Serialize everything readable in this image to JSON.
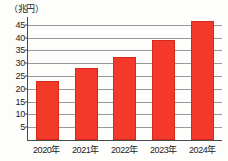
{
  "chart_data": {
    "type": "bar",
    "title": "",
    "subtitle": "",
    "unit_label": "（兆円）",
    "xlabel": "",
    "ylabel": "",
    "categories": [
      "2020年",
      "2021年",
      "2022年",
      "2023年",
      "2024年"
    ],
    "values": [
      23,
      28,
      32.5,
      39,
      46.5
    ],
    "series": [
      {
        "name": "",
        "values": [
          23,
          28,
          32.5,
          39,
          46.5
        ]
      }
    ],
    "ylim": [
      0,
      48
    ],
    "yticks": [
      5,
      10,
      15,
      20,
      25,
      30,
      35,
      40,
      45
    ],
    "ytick_labels": [
      "5",
      "10",
      "15",
      "20",
      "25",
      "30",
      "35",
      "40",
      "45"
    ],
    "grid": true,
    "legend": false,
    "legend_position": "none",
    "bar_color": "#f2392a",
    "bar_edge_color": "#d42a1c",
    "gridline_color": "#9a9a9a",
    "axis_color": "#4a4a4a",
    "background_color": "#fdfdfb",
    "text_color": "#1c1c1c"
  }
}
